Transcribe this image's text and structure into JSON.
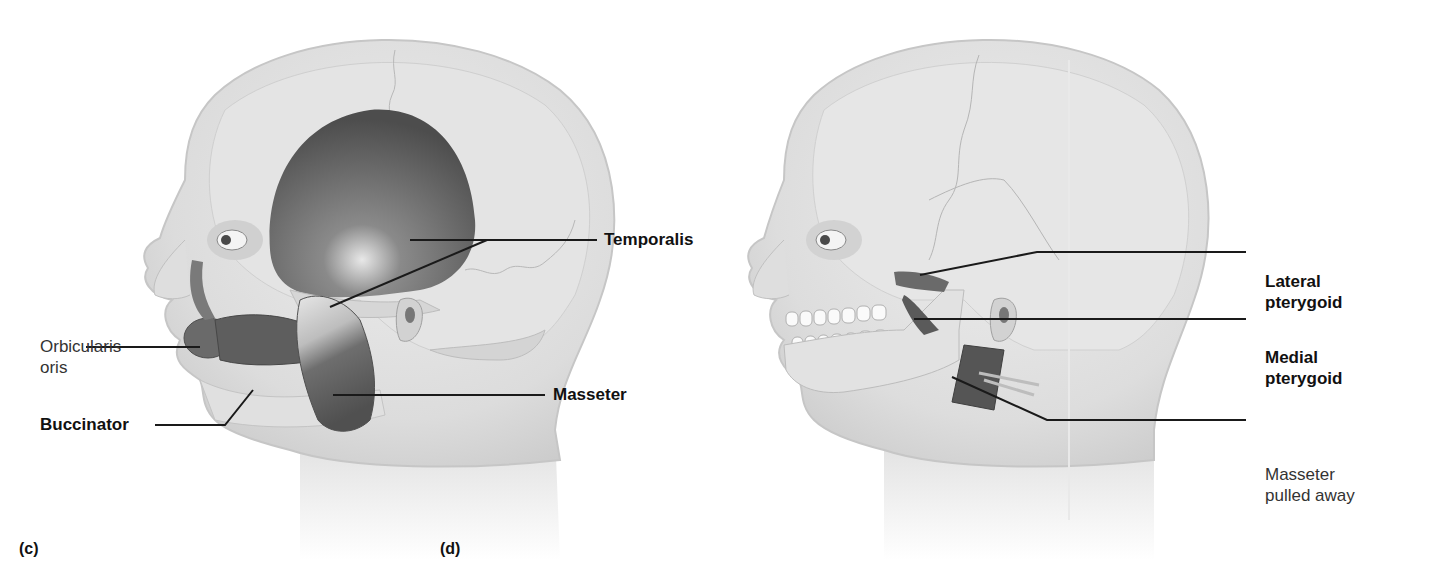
{
  "figure": {
    "panels": [
      {
        "id": "c",
        "letter": "(c)",
        "labels": {
          "temporalis": "Temporalis",
          "orbicularis_line1": "Orbicularis",
          "orbicularis_line2": "oris",
          "buccinator": "Buccinator",
          "masseter": "Masseter"
        }
      },
      {
        "id": "d",
        "letter": "(d)",
        "labels": {
          "lateral_line1": "Lateral",
          "lateral_line2": "pterygoid",
          "medial_line1": "Medial",
          "medial_line2": "pterygoid",
          "masseter_pulled_line1": "Masseter",
          "masseter_pulled_line2": "pulled away"
        }
      }
    ],
    "colors": {
      "skin": "#e2e2e2",
      "skin_outline": "#c8c8c8",
      "bone": "#d9d9d9",
      "muscle": "#6a6a6a",
      "muscle_dark": "#4a4a4a",
      "leader_line": "#1a1a1a"
    }
  }
}
